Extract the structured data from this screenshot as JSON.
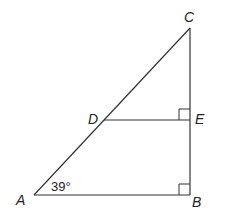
{
  "diagram": {
    "type": "geometry-triangle",
    "vertices": {
      "A": {
        "label": "A",
        "x": 34,
        "y": 195
      },
      "B": {
        "label": "B",
        "x": 190,
        "y": 195
      },
      "C": {
        "label": "C",
        "x": 190,
        "y": 28
      },
      "D": {
        "label": "D",
        "x": 104,
        "y": 120
      },
      "E": {
        "label": "E",
        "x": 190,
        "y": 120
      }
    },
    "segments": [
      "AB",
      "BC",
      "AC",
      "DE"
    ],
    "right_angles": [
      "B",
      "E"
    ],
    "angle_labels": [
      {
        "vertex": "A",
        "text": "39°"
      }
    ],
    "colors": {
      "stroke": "#333333",
      "text": "#222222",
      "background": "#ffffff"
    }
  }
}
